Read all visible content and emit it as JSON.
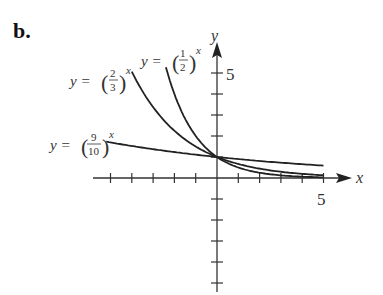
{
  "panel_label": "b.",
  "chart_data": {
    "type": "line",
    "title": "",
    "xlabel": "x",
    "ylabel": "y",
    "xlim": [
      -6,
      5.5
    ],
    "ylim": [
      -5,
      5.5
    ],
    "x_tick_label": "5",
    "y_tick_label": "5",
    "grid": false,
    "series": [
      {
        "name": "y = (2/3)^x",
        "base_num": "2",
        "base_den": "3",
        "base": 0.6667,
        "x_range": [
          -4,
          5
        ]
      },
      {
        "name": "y = (1/2)^x",
        "base_num": "1",
        "base_den": "2",
        "base": 0.5,
        "x_range": [
          -2.4,
          5
        ]
      },
      {
        "name": "y = (9/10)^x",
        "base_num": "9",
        "base_den": "10",
        "base": 0.9,
        "x_range": [
          -5.2,
          5
        ]
      }
    ],
    "annotations": [
      "y = (2/3)^x",
      "y = (1/2)^x",
      "y = (9/10)^x"
    ],
    "legend": "none (curves labeled inline)"
  },
  "labels": {
    "y_eq": "y =",
    "exp": "x",
    "axis_x": "x",
    "axis_y": "y",
    "tick_x5": "5",
    "tick_y5": "5",
    "c1_num": "2",
    "c1_den": "3",
    "c2_num": "1",
    "c2_den": "2",
    "c3_num": "9",
    "c3_den": "10"
  }
}
